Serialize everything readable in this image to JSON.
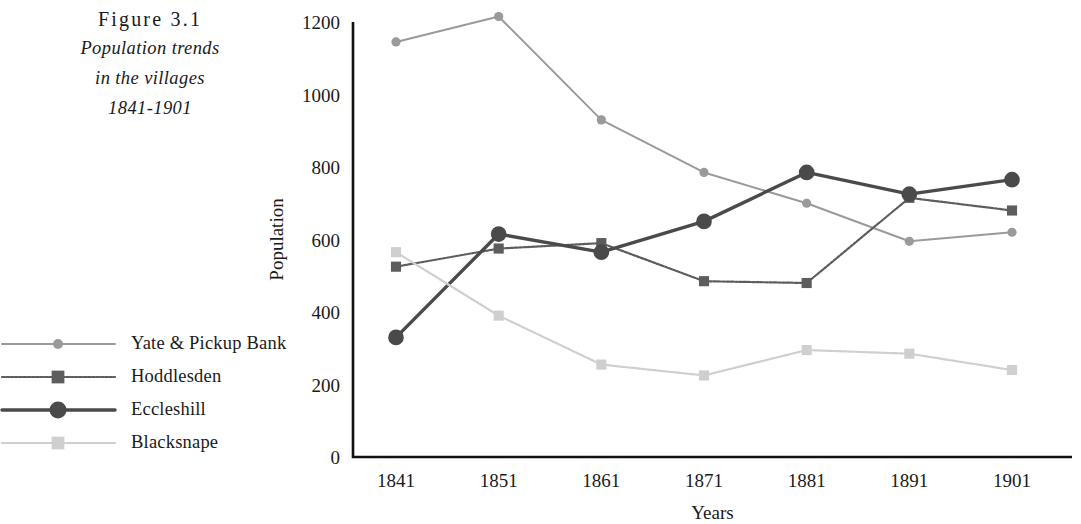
{
  "caption": {
    "figure_label": "Figure 3.1",
    "lines": [
      "Population trends",
      "in the villages",
      "1841-1901"
    ]
  },
  "legend": {
    "position": "left",
    "items": [
      {
        "label": "Yate & Pickup Bank",
        "color": "#9a9a9a",
        "marker": "circle",
        "line_width": 2.0,
        "dash": "none"
      },
      {
        "label": "Hoddlesden",
        "color": "#5d5d5d",
        "marker": "square",
        "line_width": 2.2,
        "dash": "dotted"
      },
      {
        "label": "Eccleshill",
        "color": "#4a4a4a",
        "marker": "circle",
        "line_width": 3.4,
        "dash": "none"
      },
      {
        "label": "Blacksnape",
        "color": "#cfcfcf",
        "marker": "square",
        "line_width": 2.2,
        "dash": "dotted"
      }
    ]
  },
  "axes": {
    "y_ticks": [
      "0",
      "200",
      "400",
      "600",
      "800",
      "1000",
      "1200"
    ],
    "x_ticks": [
      "1841",
      "1851",
      "1861",
      "1871",
      "1881",
      "1891",
      "1901"
    ],
    "x_title": "Years",
    "y_title": "Population",
    "axis_color": "#111111"
  },
  "chart_data": {
    "type": "line",
    "title": "Population trends in the villages 1841-1901",
    "xlabel": "Years",
    "ylabel": "Population",
    "categories": [
      1841,
      1851,
      1861,
      1871,
      1881,
      1891,
      1901
    ],
    "ylim": [
      0,
      1200
    ],
    "ytick_step": 200,
    "grid": false,
    "legend_position": "left",
    "series": [
      {
        "name": "Yate & Pickup Bank",
        "color": "#9a9a9a",
        "marker": "circle",
        "values": [
          1145,
          1215,
          930,
          785,
          700,
          595,
          620
        ]
      },
      {
        "name": "Hoddlesden",
        "color": "#5d5d5d",
        "marker": "square",
        "values": [
          525,
          575,
          590,
          485,
          480,
          715,
          680
        ]
      },
      {
        "name": "Eccleshill",
        "color": "#4a4a4a",
        "marker": "circle",
        "values": [
          330,
          615,
          565,
          650,
          785,
          725,
          765
        ]
      },
      {
        "name": "Blacksnape",
        "color": "#cfcfcf",
        "marker": "square",
        "values": [
          565,
          390,
          255,
          225,
          295,
          285,
          240
        ]
      }
    ]
  }
}
